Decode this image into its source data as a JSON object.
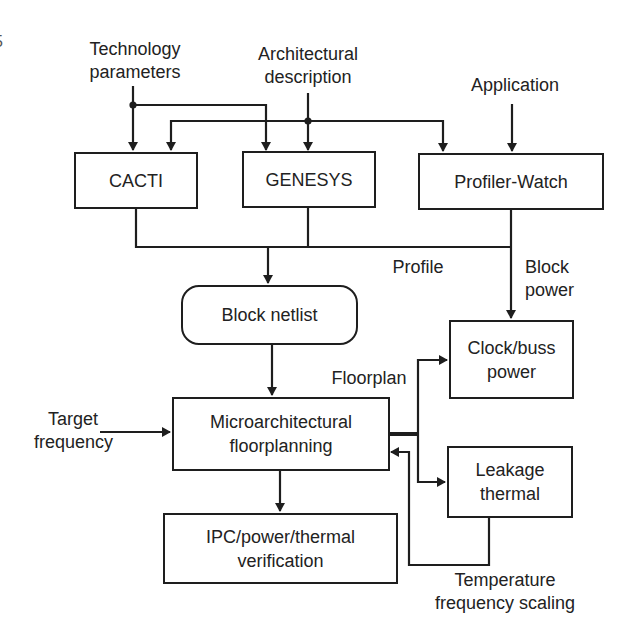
{
  "page_marker": "5",
  "inputs": {
    "technology": [
      "Technology",
      "parameters"
    ],
    "architectural": [
      "Architectural",
      "description"
    ],
    "application": "Application",
    "target_frequency": [
      "Target",
      "frequency"
    ]
  },
  "blocks": {
    "cacti": "CACTI",
    "genesys": "GENESYS",
    "profiler_watch": "Profiler-Watch",
    "block_netlist": "Block netlist",
    "clock_buss_power": [
      "Clock/buss",
      "power"
    ],
    "microarch_floorplanning": [
      "Microarchitectural",
      "floorplanning"
    ],
    "leakage_thermal": [
      "Leakage",
      "thermal"
    ],
    "ipc_verification": [
      "IPC/power/thermal",
      "verification"
    ]
  },
  "edge_labels": {
    "profile": "Profile",
    "block_power": [
      "Block",
      "power"
    ],
    "floorplan": "Floorplan",
    "temperature_scaling": [
      "Temperature",
      "frequency scaling"
    ]
  },
  "colors": {
    "line": "#1e1e1e",
    "background": "#ffffff"
  }
}
